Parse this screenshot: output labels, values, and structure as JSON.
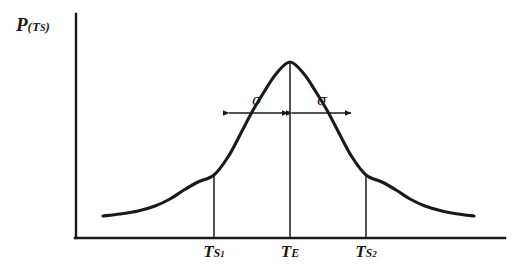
{
  "figure": {
    "type": "gaussian-distribution-plot",
    "background_color": "#ffffff",
    "ink_color": "#1a1a1a"
  },
  "axes": {
    "y_label": {
      "main": "P",
      "paren_open": "(",
      "sub_main": "T",
      "sub_sub": "S",
      "paren_close": ")"
    },
    "x_origin_px": 76,
    "x_end_px": 505,
    "y_top_px": 14,
    "y_baseline_px": 238
  },
  "x_ticks": [
    {
      "name": "t-s1",
      "label_main": "T",
      "label_sub": "S",
      "label_subsub": "1",
      "x_px": 214,
      "line_top_px": 175
    },
    {
      "name": "t-e",
      "label_main": "T",
      "label_sub": "E",
      "label_subsub": "",
      "x_px": 290,
      "line_top_px": 62
    },
    {
      "name": "t-s2",
      "label_main": "T",
      "label_sub": "S",
      "label_subsub": "2",
      "x_px": 366,
      "line_top_px": 175
    }
  ],
  "annotations": [
    {
      "name": "sigma-left",
      "symbol": "σ",
      "label_x_px": 257,
      "label_y_px": 91,
      "arrow_from_px": 229,
      "arrow_to_px": 288,
      "arrow_y_px": 113
    },
    {
      "name": "sigma-right",
      "symbol": "σ",
      "label_x_px": 322,
      "label_y_px": 91,
      "arrow_from_px": 292,
      "arrow_to_px": 351,
      "arrow_y_px": 113
    }
  ],
  "chart_data": {
    "type": "line",
    "title": "",
    "xlabel": "",
    "ylabel": "P(Ts)",
    "grid": false,
    "legend": null,
    "x_tick_labels": [
      "T_S1",
      "T_E",
      "T_S2"
    ],
    "x_tick_positions_px": [
      214,
      290,
      366
    ],
    "curve_description": "Symmetric bell-shaped (Gaussian) probability density curve, peak at T_E, inflection points at T_S1 and T_S2, flat tails at both ends",
    "peak_x_px": 290,
    "peak_y_px": 62,
    "baseline_y_px": 238,
    "curve_start_x_px": 103,
    "curve_end_x_px": 474,
    "tail_y_px": 216,
    "curve_points_px": [
      [
        103,
        216
      ],
      [
        120,
        214
      ],
      [
        138,
        211
      ],
      [
        155,
        206
      ],
      [
        170,
        199
      ],
      [
        184,
        190
      ],
      [
        198,
        182
      ],
      [
        214,
        175
      ],
      [
        228,
        157
      ],
      [
        240,
        135
      ],
      [
        252,
        112
      ],
      [
        264,
        92
      ],
      [
        276,
        74
      ],
      [
        290,
        62
      ],
      [
        304,
        74
      ],
      [
        316,
        92
      ],
      [
        328,
        112
      ],
      [
        340,
        135
      ],
      [
        352,
        157
      ],
      [
        366,
        175
      ],
      [
        382,
        182
      ],
      [
        396,
        190
      ],
      [
        410,
        199
      ],
      [
        425,
        206
      ],
      [
        442,
        211
      ],
      [
        458,
        214
      ],
      [
        474,
        216
      ]
    ]
  }
}
